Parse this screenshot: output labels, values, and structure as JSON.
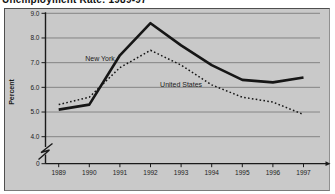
{
  "page": {
    "title": "Unemployment Rate: 1989-97"
  },
  "chart_data": {
    "type": "line",
    "title": "Unemployment Rate: 1989-97",
    "xlabel": "",
    "ylabel": "Percent",
    "categories": [
      "1989",
      "1990",
      "1991",
      "1992",
      "1993",
      "1994",
      "1995",
      "1996",
      "1997"
    ],
    "series": [
      {
        "name": "New York",
        "line_style": "solid",
        "color": "#161616",
        "values": [
          5.1,
          5.3,
          7.3,
          8.6,
          7.7,
          6.9,
          6.3,
          6.2,
          6.4
        ]
      },
      {
        "name": "United States",
        "line_style": "dotted",
        "color": "#161616",
        "values": [
          5.3,
          5.6,
          6.8,
          7.5,
          6.9,
          6.1,
          5.6,
          5.4,
          4.9
        ]
      }
    ],
    "yticks": [
      "9.0",
      "8.0",
      "7.0",
      "6.0",
      "5.0",
      "4.0"
    ],
    "y_origin_label": "0",
    "ylim": [
      4.0,
      9.0
    ],
    "axis_break": true,
    "grid": true,
    "legend_position": "inline-labels",
    "annotations": [
      {
        "text": "New York",
        "x": 1990.35,
        "y": 7.15
      },
      {
        "text": "United States",
        "x": 1993.0,
        "y": 6.12
      }
    ],
    "colors": {
      "panel_bg": "#c9c9c9",
      "grid": "#7d7d7d",
      "axis": "#1a1a1a",
      "text": "#1c1c1c"
    }
  }
}
